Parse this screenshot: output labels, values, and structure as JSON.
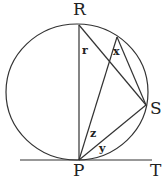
{
  "diagram": {
    "type": "circle-geometry",
    "points": {
      "R": {
        "label": "R",
        "x": 79,
        "y": 25
      },
      "P": {
        "label": "P",
        "x": 79,
        "y": 160
      },
      "S": {
        "label": "S",
        "x": 146,
        "y": 105
      },
      "X": {
        "x": 117,
        "y": 37
      },
      "T": {
        "label": "T",
        "x": 150,
        "y": 160
      }
    },
    "circle": {
      "cx": 77,
      "cy": 92,
      "rx": 71,
      "ry": 68
    },
    "angle_labels": {
      "r": "r",
      "x": "x",
      "y": "y",
      "z": "z"
    },
    "labels": {
      "R": "R",
      "P": "P",
      "S": "S",
      "T": "T"
    },
    "colors": {
      "line": "#333333",
      "text": "#222222"
    }
  }
}
